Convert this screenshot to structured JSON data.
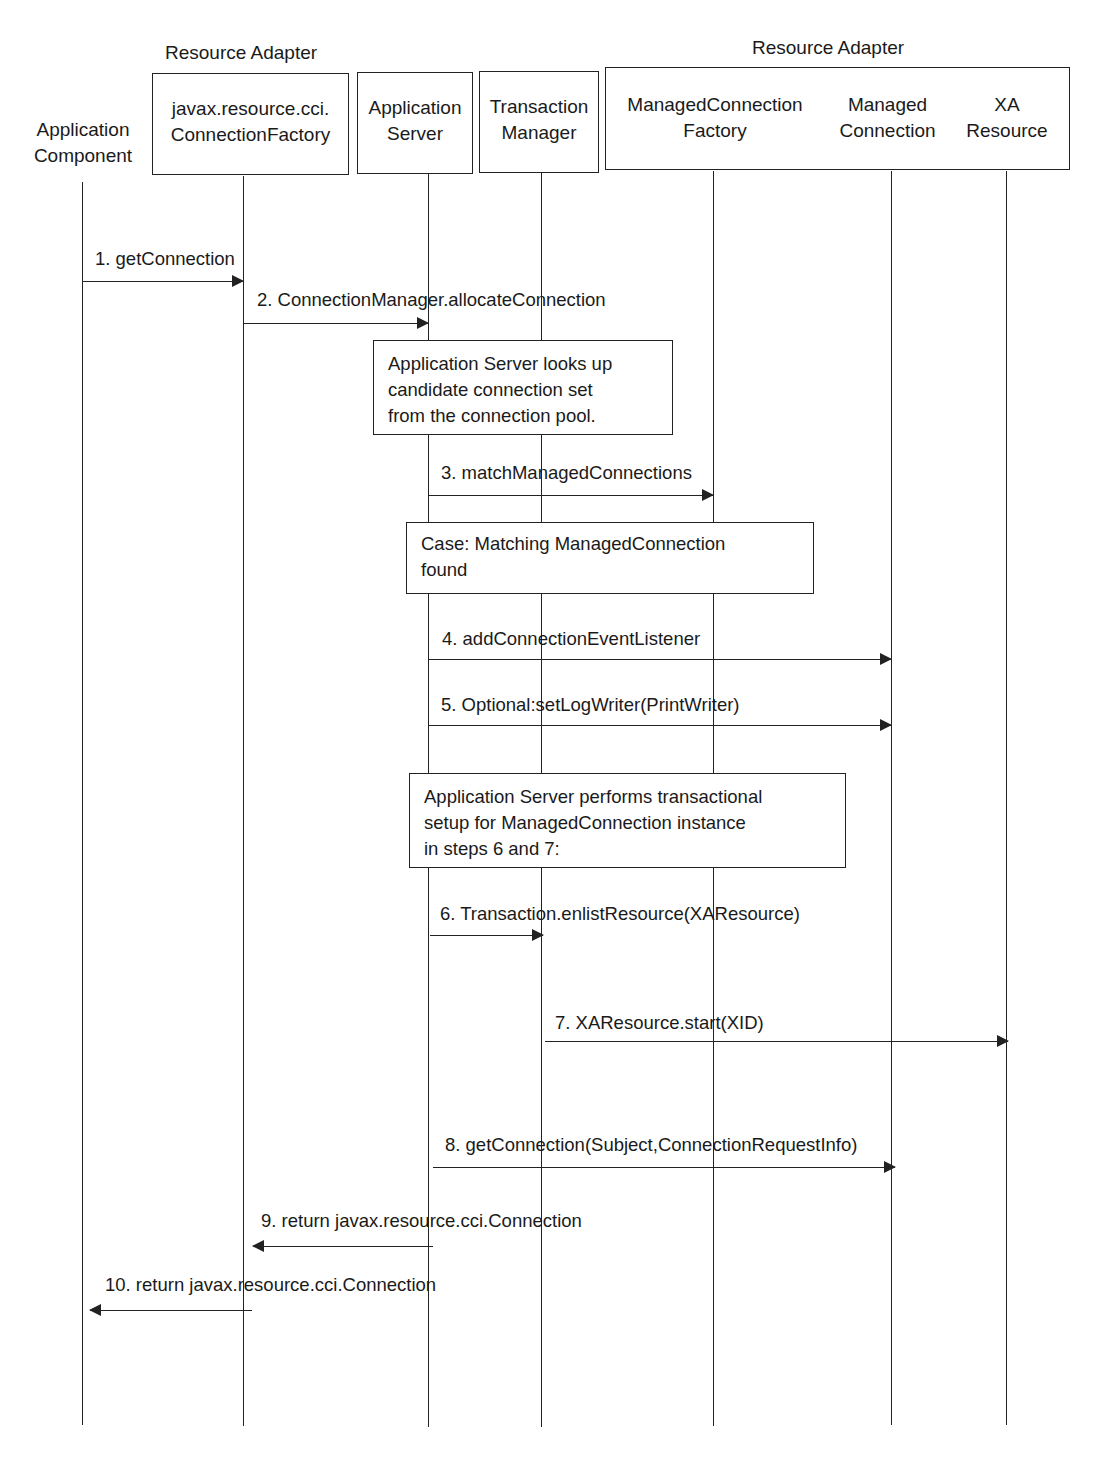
{
  "diagram": {
    "type": "sequence",
    "groups": [
      {
        "label": "Resource Adapter",
        "spans": [
          "javax.resource.cci.ConnectionFactory"
        ]
      },
      {
        "label": "Resource Adapter",
        "spans": [
          "ManagedConnectionFactory",
          "ManagedConnection",
          "XAResource"
        ]
      }
    ],
    "participants": [
      {
        "id": "app_component",
        "line1": "Application",
        "line2": "Component",
        "boxed": false
      },
      {
        "id": "cci_cf",
        "line1": "javax.resource.cci.",
        "line2": "ConnectionFactory",
        "boxed": true
      },
      {
        "id": "app_server",
        "line1": "Application",
        "line2": "Server",
        "boxed": true
      },
      {
        "id": "tx_manager",
        "line1": "Transaction",
        "line2": "Manager",
        "boxed": true
      },
      {
        "id": "mcf",
        "line1": "ManagedConnection",
        "line2": "Factory",
        "boxed": true
      },
      {
        "id": "mc",
        "line1": "Managed",
        "line2": "Connection",
        "boxed": true
      },
      {
        "id": "xa",
        "line1": "XA",
        "line2": "Resource",
        "boxed": true
      }
    ],
    "messages": [
      {
        "n": 1,
        "label": "1. getConnection",
        "from": "app_component",
        "to": "cci_cf"
      },
      {
        "n": 2,
        "label": "2. ConnectionManager.allocateConnection",
        "from": "cci_cf",
        "to": "app_server"
      },
      {
        "n": 3,
        "label": "3. matchManagedConnections",
        "from": "app_server",
        "to": "mcf"
      },
      {
        "n": 4,
        "label": "4. addConnectionEventListener",
        "from": "app_server",
        "to": "mc"
      },
      {
        "n": 5,
        "label": "5. Optional:setLogWriter(PrintWriter)",
        "from": "app_server",
        "to": "mc"
      },
      {
        "n": 6,
        "label": "6. Transaction.enlistResource(XAResource)",
        "from": "app_server",
        "to": "tx_manager"
      },
      {
        "n": 7,
        "label": "7. XAResource.start(XID)",
        "from": "tx_manager",
        "to": "xa"
      },
      {
        "n": 8,
        "label": "8. getConnection(Subject,ConnectionRequestInfo)",
        "from": "app_server",
        "to": "mc"
      },
      {
        "n": 9,
        "label": "9. return javax.resource.cci.Connection",
        "from": "app_server",
        "to": "cci_cf"
      },
      {
        "n": 10,
        "label": "10. return javax.resource.cci.Connection",
        "from": "cci_cf",
        "to": "app_component"
      }
    ],
    "notes": [
      {
        "lines": [
          "Application Server looks up",
          "candidate connection set",
          "from the connection pool."
        ]
      },
      {
        "lines": [
          "Case: Matching ManagedConnection",
          "found"
        ]
      },
      {
        "lines": [
          "Application Server performs transactional",
          "setup for ManagedConnection instance",
          "in steps 6 and 7:"
        ]
      }
    ]
  }
}
